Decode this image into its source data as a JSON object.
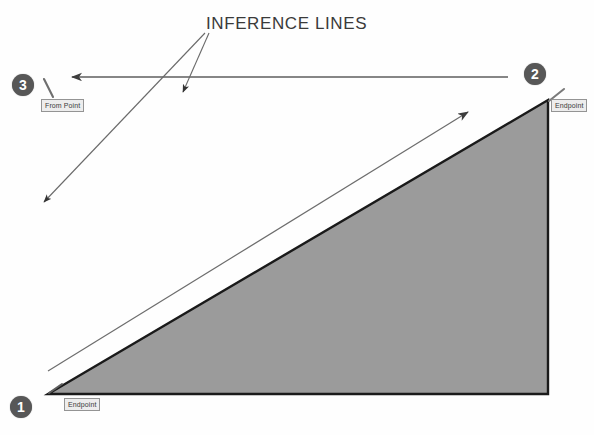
{
  "canvas": {
    "width": 594,
    "height": 435,
    "background_color": "#fefefe",
    "title": "Inference Lines Diagram"
  },
  "annotation": {
    "title_label": "INFERENCE LINES"
  },
  "markers": [
    {
      "id": "1",
      "label": "1",
      "x": 21,
      "y": 407,
      "tooltip": "Endpoint"
    },
    {
      "id": "2",
      "label": "2",
      "x": 535,
      "y": 74,
      "tooltip": "Endpoint"
    },
    {
      "id": "3",
      "label": "3",
      "x": 23,
      "y": 85,
      "tooltip": "From Point"
    }
  ],
  "tooltips": {
    "from_point": "From Point",
    "endpoint_top": "Endpoint",
    "endpoint_bottom": "Endpoint"
  },
  "shape": {
    "name": "shaded-triangle",
    "fill_color": "#9b9b9b",
    "stroke_color": "#1a1a1a",
    "points": "48,394 548,394 548,100"
  },
  "colors": {
    "marker_fill": "#575757",
    "marker_text": "#ffffff",
    "triangle_fill": "#9b9b9b",
    "triangle_stroke": "#1a1a1a",
    "inference_line": "#5e5e5e",
    "leader_line": "#6a6a6a",
    "tooltip_bg": "#ececec",
    "tooltip_border": "#8c8c8c",
    "title_text": "#3a3a3a"
  },
  "lines": {
    "horizontal_inference": {
      "name": "horizontal-inference-line",
      "from_x": 508,
      "from_y": 77,
      "to_x": 66,
      "to_y": 77,
      "arrow_end": "to"
    },
    "diagonal_inference": {
      "name": "diagonal-inference-line",
      "from_x": 48,
      "from_y": 371,
      "to_x": 471,
      "to_y": 110,
      "arrow_end": "to"
    },
    "leader_long": {
      "name": "leader-line-long",
      "from_x": 205,
      "from_y": 33,
      "to_x": 40,
      "to_y": 206,
      "arrow_end": "to"
    },
    "leader_short": {
      "name": "leader-line-short",
      "from_x": 208,
      "from_y": 33,
      "to_x": 182,
      "to_y": 96,
      "arrow_end": "to"
    },
    "cursor_from_point": {
      "name": "cursor-pencil-from-point",
      "from_x": 52,
      "from_y": 95,
      "to_x": 44,
      "to_y": 80
    },
    "cursor_endpoint_top": {
      "name": "cursor-pencil-endpoint-top",
      "from_x": 562,
      "from_y": 92,
      "to_x": 549,
      "to_y": 101
    },
    "cursor_endpoint_bottom": {
      "name": "cursor-pencil-endpoint-bottom",
      "from_x": 60,
      "from_y": 386,
      "to_x": 49,
      "to_y": 393
    }
  }
}
